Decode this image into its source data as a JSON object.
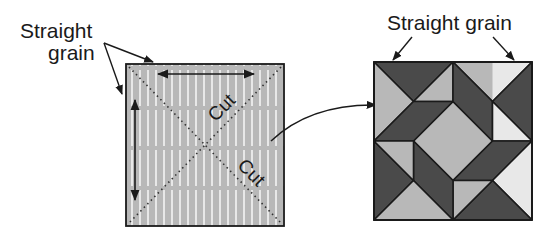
{
  "left_panel": {
    "label_line1": "Straight",
    "label_line2": "grain",
    "cut_label_upper": "Cut",
    "cut_label_lower": "Cut",
    "square": {
      "x": 126,
      "y": 64,
      "size": 158
    },
    "fabric": "light striped"
  },
  "right_panel": {
    "label": "Straight grain",
    "block": {
      "x": 374,
      "y": 62,
      "size": 158,
      "grid_units": 4
    },
    "fabrics": {
      "light": "light striped",
      "dark": "dark floral"
    }
  },
  "colors": {
    "light_fabric": "#b8b8b8",
    "light_stripe": "#e6e6e6",
    "dark_fabric": "#4a4a4a",
    "flower": "#b0b0b0",
    "outline": "#1a1a1a",
    "background": "#ffffff"
  }
}
